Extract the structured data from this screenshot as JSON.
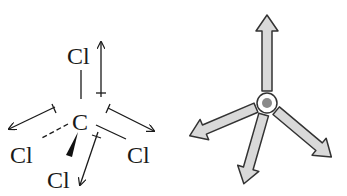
{
  "left_figure": {
    "description": "CCl4 bond dipoles",
    "central_atom": "C",
    "atoms": [
      {
        "label": "Cl",
        "position": "top"
      },
      {
        "label": "Cl",
        "position": "left"
      },
      {
        "label": "Cl",
        "position": "right"
      },
      {
        "label": "Cl",
        "position": "bottom"
      }
    ]
  },
  "right_figure": {
    "description": "Vector sum of four bond dipoles (net zero)",
    "arrow_count": 4,
    "colors": {
      "arrow_fill": "#d9d9d9",
      "outline": "#333333",
      "center_dot": "#8a8a8a"
    }
  }
}
